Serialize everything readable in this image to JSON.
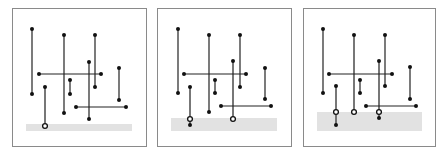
{
  "figure": {
    "colors": {
      "frame": "#8a8a8a",
      "band": "#e2e2e2",
      "segment": "#222222",
      "endpoint": "#111111"
    },
    "panels": [
      {
        "name": "panel-1",
        "frame": {
          "x": 12.5,
          "y": 8.5,
          "w": 134,
          "h": 138
        },
        "band": {
          "x": 26,
          "y": 124,
          "w": 106,
          "h": 7
        },
        "vertical_segments": [
          {
            "x": 32,
            "y1": 29,
            "y2": 94
          },
          {
            "x": 64,
            "y1": 35,
            "y2": 113
          },
          {
            "x": 95,
            "y1": 35,
            "y2": 87
          },
          {
            "x": 89,
            "y1": 62,
            "y2": 119
          },
          {
            "x": 119,
            "y1": 68,
            "y2": 100
          },
          {
            "x": 70,
            "y1": 80,
            "y2": 94
          },
          {
            "x": 45,
            "y1": 87,
            "y2": 126,
            "active": true
          }
        ],
        "horizontal_segments": [
          {
            "y": 74,
            "x1": 39,
            "x2": 101
          },
          {
            "y": 107,
            "x1": 76,
            "x2": 126
          }
        ],
        "dots": [
          [
            32,
            29
          ],
          [
            32,
            94
          ],
          [
            64,
            35
          ],
          [
            64,
            113
          ],
          [
            95,
            35
          ],
          [
            95,
            87
          ],
          [
            89,
            62
          ],
          [
            89,
            119
          ],
          [
            119,
            68
          ],
          [
            119,
            100
          ],
          [
            70,
            80
          ],
          [
            70,
            94
          ],
          [
            45,
            87
          ],
          [
            39,
            74
          ],
          [
            101,
            74
          ],
          [
            76,
            107
          ],
          [
            126,
            107
          ]
        ],
        "rings": [
          [
            45,
            126
          ]
        ]
      },
      {
        "name": "panel-2",
        "frame": {
          "x": 157.5,
          "y": 8.5,
          "w": 134,
          "h": 138
        },
        "band": {
          "x": 171,
          "y": 118,
          "w": 106,
          "h": 13
        },
        "vertical_segments": [
          {
            "x": 178,
            "y1": 29,
            "y2": 93
          },
          {
            "x": 209,
            "y1": 35,
            "y2": 112
          },
          {
            "x": 240,
            "y1": 35,
            "y2": 87
          },
          {
            "x": 233,
            "y1": 61,
            "y2": 119,
            "active": true
          },
          {
            "x": 265,
            "y1": 68,
            "y2": 99
          },
          {
            "x": 215,
            "y1": 80,
            "y2": 93
          },
          {
            "x": 190,
            "y1": 87,
            "y2": 125,
            "active": true
          }
        ],
        "horizontal_segments": [
          {
            "y": 74,
            "x1": 184,
            "x2": 246
          },
          {
            "y": 106,
            "x1": 221,
            "x2": 271
          }
        ],
        "dots": [
          [
            178,
            29
          ],
          [
            178,
            93
          ],
          [
            209,
            35
          ],
          [
            209,
            112
          ],
          [
            240,
            35
          ],
          [
            240,
            87
          ],
          [
            233,
            61
          ],
          [
            265,
            68
          ],
          [
            265,
            99
          ],
          [
            215,
            80
          ],
          [
            215,
            93
          ],
          [
            190,
            87
          ],
          [
            190,
            125
          ],
          [
            184,
            74
          ],
          [
            246,
            74
          ],
          [
            221,
            106
          ],
          [
            271,
            106
          ]
        ],
        "rings": [
          [
            190,
            119
          ],
          [
            233,
            119
          ]
        ]
      },
      {
        "name": "panel-3",
        "frame": {
          "x": 303.5,
          "y": 8.5,
          "w": 132,
          "h": 138
        },
        "band": {
          "x": 317,
          "y": 112,
          "w": 105,
          "h": 19
        },
        "vertical_segments": [
          {
            "x": 323,
            "y1": 29,
            "y2": 93
          },
          {
            "x": 354,
            "y1": 35,
            "y2": 112,
            "active": true
          },
          {
            "x": 385,
            "y1": 35,
            "y2": 86
          },
          {
            "x": 379,
            "y1": 61,
            "y2": 118,
            "active": true
          },
          {
            "x": 410,
            "y1": 67,
            "y2": 99
          },
          {
            "x": 360,
            "y1": 80,
            "y2": 93
          },
          {
            "x": 336,
            "y1": 86,
            "y2": 125,
            "active": true
          }
        ],
        "horizontal_segments": [
          {
            "y": 74,
            "x1": 329,
            "x2": 392
          },
          {
            "y": 106,
            "x1": 366,
            "x2": 416
          }
        ],
        "dots": [
          [
            323,
            29
          ],
          [
            323,
            93
          ],
          [
            354,
            35
          ],
          [
            385,
            35
          ],
          [
            385,
            86
          ],
          [
            379,
            61
          ],
          [
            379,
            118
          ],
          [
            410,
            67
          ],
          [
            410,
            99
          ],
          [
            360,
            80
          ],
          [
            360,
            93
          ],
          [
            336,
            86
          ],
          [
            336,
            125
          ],
          [
            329,
            74
          ],
          [
            392,
            74
          ],
          [
            366,
            106
          ],
          [
            416,
            106
          ]
        ],
        "rings": [
          [
            336,
            112
          ],
          [
            354,
            112
          ],
          [
            379,
            112
          ]
        ]
      }
    ]
  }
}
